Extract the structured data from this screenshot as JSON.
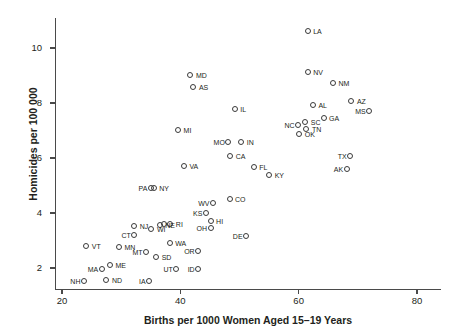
{
  "chart_data": {
    "type": "scatter",
    "title": "",
    "xlabel": "Births per 1000 Women Aged 15–19 Years",
    "ylabel": "Homicides per 100 000",
    "xlim": [
      20,
      80
    ],
    "ylim": [
      1.3,
      10.9
    ],
    "xticks": [
      20,
      40,
      60,
      80
    ],
    "yticks": [
      2,
      4,
      6,
      8,
      10
    ],
    "grid": false,
    "legend": null,
    "points": [
      {
        "label": "LA",
        "x": 61.6,
        "y": 10.6,
        "pos": "right"
      },
      {
        "label": "NV",
        "x": 61.6,
        "y": 9.1,
        "pos": "right"
      },
      {
        "label": "NM",
        "x": 65.9,
        "y": 8.7,
        "pos": "right"
      },
      {
        "label": "MD",
        "x": 41.8,
        "y": 9.0,
        "pos": "right"
      },
      {
        "label": "AS",
        "x": 42.3,
        "y": 8.55,
        "pos": "right"
      },
      {
        "label": "AZ",
        "x": 69.0,
        "y": 8.05,
        "pos": "right"
      },
      {
        "label": "AL",
        "x": 62.5,
        "y": 7.9,
        "pos": "right"
      },
      {
        "label": "IL",
        "x": 49.3,
        "y": 7.75,
        "pos": "right"
      },
      {
        "label": "MS",
        "x": 72.0,
        "y": 7.7,
        "pos": "left"
      },
      {
        "label": "GA",
        "x": 64.3,
        "y": 7.45,
        "pos": "right"
      },
      {
        "label": "SC",
        "x": 61.2,
        "y": 7.3,
        "pos": "right"
      },
      {
        "label": "NC",
        "x": 60.0,
        "y": 7.2,
        "pos": "left"
      },
      {
        "label": "TN",
        "x": 61.4,
        "y": 7.05,
        "pos": "right"
      },
      {
        "label": "MI",
        "x": 39.7,
        "y": 7.0,
        "pos": "right"
      },
      {
        "label": "OK",
        "x": 60.2,
        "y": 6.85,
        "pos": "right"
      },
      {
        "label": "MO",
        "x": 48.2,
        "y": 6.55,
        "pos": "left"
      },
      {
        "label": "IN",
        "x": 50.4,
        "y": 6.55,
        "pos": "right"
      },
      {
        "label": "CA",
        "x": 48.5,
        "y": 6.05,
        "pos": "right"
      },
      {
        "label": "TX",
        "x": 68.8,
        "y": 6.05,
        "pos": "left"
      },
      {
        "label": "VA",
        "x": 40.7,
        "y": 5.7,
        "pos": "right"
      },
      {
        "label": "FL",
        "x": 52.5,
        "y": 5.65,
        "pos": "right"
      },
      {
        "label": "AK",
        "x": 68.2,
        "y": 5.6,
        "pos": "left"
      },
      {
        "label": "KY",
        "x": 55.1,
        "y": 5.35,
        "pos": "right"
      },
      {
        "label": "PA",
        "x": 35.1,
        "y": 4.9,
        "pos": "left"
      },
      {
        "label": "NY",
        "x": 35.6,
        "y": 4.9,
        "pos": "right"
      },
      {
        "label": "CO",
        "x": 48.4,
        "y": 4.5,
        "pos": "right"
      },
      {
        "label": "WV",
        "x": 45.6,
        "y": 4.35,
        "pos": "left"
      },
      {
        "label": "KS",
        "x": 44.4,
        "y": 4.0,
        "pos": "left"
      },
      {
        "label": "HI",
        "x": 45.2,
        "y": 3.7,
        "pos": "right"
      },
      {
        "label": "RI",
        "x": 38.4,
        "y": 3.6,
        "pos": "right"
      },
      {
        "label": "NE",
        "x": 36.6,
        "y": 3.55,
        "pos": "right"
      },
      {
        "label": "NJ",
        "x": 32.3,
        "y": 3.5,
        "pos": "right"
      },
      {
        "label": "OH",
        "x": 45.2,
        "y": 3.45,
        "pos": "left"
      },
      {
        "label": "WI",
        "x": 35.2,
        "y": 3.4,
        "pos": "right"
      },
      {
        "label": "RI2",
        "x": 37.3,
        "y": 3.6,
        "pos": "none"
      },
      {
        "label": "CT",
        "x": 32.3,
        "y": 3.2,
        "pos": "left"
      },
      {
        "label": "DE",
        "x": 51.2,
        "y": 3.15,
        "pos": "left"
      },
      {
        "label": "WA",
        "x": 38.3,
        "y": 2.9,
        "pos": "right"
      },
      {
        "label": "VT",
        "x": 24.2,
        "y": 2.8,
        "pos": "right"
      },
      {
        "label": "MN",
        "x": 29.7,
        "y": 2.75,
        "pos": "right"
      },
      {
        "label": "OR",
        "x": 43.1,
        "y": 2.6,
        "pos": "left"
      },
      {
        "label": "MT",
        "x": 34.3,
        "y": 2.55,
        "pos": "left"
      },
      {
        "label": "SD",
        "x": 36.0,
        "y": 2.4,
        "pos": "right"
      },
      {
        "label": "ME",
        "x": 28.2,
        "y": 2.1,
        "pos": "right"
      },
      {
        "label": "MA",
        "x": 26.8,
        "y": 1.95,
        "pos": "left"
      },
      {
        "label": "UT",
        "x": 39.4,
        "y": 1.95,
        "pos": "left"
      },
      {
        "label": "ID",
        "x": 43.1,
        "y": 1.95,
        "pos": "left"
      },
      {
        "label": "ND",
        "x": 27.6,
        "y": 1.55,
        "pos": "right"
      },
      {
        "label": "NH",
        "x": 23.8,
        "y": 1.5,
        "pos": "left"
      },
      {
        "label": "IA",
        "x": 34.8,
        "y": 1.5,
        "pos": "left"
      }
    ]
  }
}
